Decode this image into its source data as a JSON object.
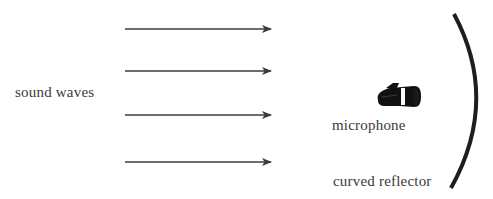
{
  "diagram": {
    "labels": {
      "sound_waves": "sound waves",
      "microphone": "microphone",
      "reflector": "curved reflector"
    },
    "arrows": [
      {
        "x1": 125,
        "x2": 272,
        "y": 29
      },
      {
        "x1": 125,
        "x2": 272,
        "y": 71
      },
      {
        "x1": 125,
        "x2": 272,
        "y": 115
      },
      {
        "x1": 125,
        "x2": 272,
        "y": 162
      }
    ],
    "icons": {
      "microphone": "microphone-icon",
      "reflector": "curved-reflector-arc"
    },
    "colors": {
      "arrow": "#3c3c3c",
      "reflector": "#1e1e1e",
      "microphone": "#111111",
      "text": "#3a3a3a"
    }
  }
}
